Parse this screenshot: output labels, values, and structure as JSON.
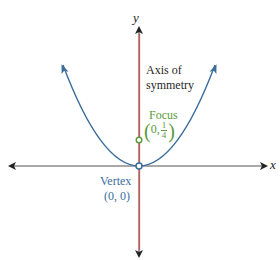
{
  "diagram": {
    "axes": {
      "x_label": "x",
      "y_label": "y"
    },
    "labels": {
      "axis_of_symmetry_line1": "Axis of",
      "axis_of_symmetry_line2": "symmetry",
      "focus_title": "Focus",
      "focus_coord_x": "0,",
      "focus_coord_num": "1",
      "focus_coord_den": "4",
      "focus_open_paren": "(",
      "focus_close_paren": ")",
      "vertex_title": "Vertex",
      "vertex_coord": "(0, 0)"
    },
    "points": {
      "vertex": {
        "x": 0,
        "y": 0
      },
      "focus": {
        "x": 0,
        "y": 0.25
      }
    },
    "colors": {
      "parabola": "#3b6d9b",
      "axis_of_symmetry": "#d9534f",
      "axes": "#333333",
      "focus": "#5a9a3a",
      "vertex_label": "#3b6d9b"
    },
    "equation_implied": "y = x^2"
  }
}
